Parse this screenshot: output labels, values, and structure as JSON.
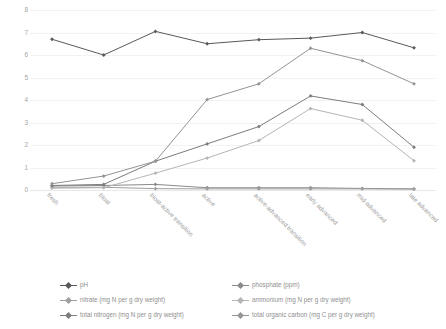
{
  "chart_data": {
    "type": "line",
    "title": "",
    "xlabel": "",
    "ylabel": "",
    "ylim": [
      0,
      8
    ],
    "yticks": [
      0,
      1,
      2,
      3,
      4,
      5,
      6,
      7,
      8
    ],
    "grid": true,
    "legend_position": "bottom",
    "categories": [
      "fresh",
      "bloat",
      "bloat-active transition",
      "active",
      "active-advanced transition",
      "early advanced",
      "mid-advanced",
      "late advanced"
    ],
    "series": [
      {
        "name": "pH",
        "color": "#595959",
        "values": [
          6.7,
          6.0,
          7.05,
          6.5,
          6.68,
          6.75,
          7.0,
          6.32
        ]
      },
      {
        "name": "phosphate (ppm)",
        "color": "#8a8a8a",
        "values": [
          0.18,
          0.2,
          0.25,
          0.1,
          0.1,
          0.1,
          0.07,
          0.05
        ]
      },
      {
        "name": "nitrate (mg N per g dry weight)",
        "color": "#9e9e9e",
        "values": [
          0.12,
          0.12,
          0.06,
          0.05,
          0.05,
          0.05,
          0.05,
          0.04
        ]
      },
      {
        "name": "ammonium (mg N per g dry weight)",
        "color": "#b5b5b5",
        "values": [
          0.08,
          0.1,
          0.75,
          1.42,
          2.2,
          3.62,
          3.1,
          1.3
        ]
      },
      {
        "name": "total nitrogen (mg N per g dry weight)",
        "color": "#7d7d7d",
        "values": [
          0.2,
          0.25,
          1.28,
          2.05,
          2.82,
          4.18,
          3.8,
          1.9
        ]
      },
      {
        "name": "total organic carbon (mg C per g dry weight)",
        "color": "#949494",
        "values": [
          0.28,
          0.62,
          1.28,
          4.02,
          4.72,
          6.3,
          5.75,
          4.72
        ]
      }
    ]
  },
  "legend": {
    "column_left": [
      "pH",
      "nitrate (mg N per g dry weight)",
      "total nitrogen (mg N per g dry weight)"
    ],
    "column_right": [
      "phosphate (ppm)",
      "ammonium (mg N per g dry weight)",
      "total organic carbon (mg C per g dry weight)"
    ]
  }
}
